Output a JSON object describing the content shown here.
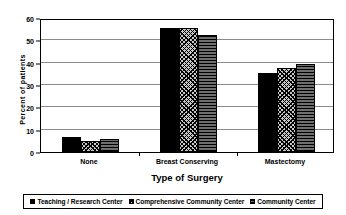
{
  "chart_data": {
    "type": "bar",
    "title": "",
    "xlabel": "Type of Surgery",
    "ylabel": "Percent of patients",
    "categories": [
      "None",
      "Breast Conserving",
      "Mastectomy"
    ],
    "series": [
      {
        "name": "Teaching / Research Center",
        "values": [
          6.5,
          55.5,
          35.5
        ],
        "pattern": "solid-black"
      },
      {
        "name": "Comprehensive Community Center",
        "values": [
          5.0,
          55.5,
          37.5
        ],
        "pattern": "cross-hatch"
      },
      {
        "name": "Community Center",
        "values": [
          6.0,
          52.5,
          39.5
        ],
        "pattern": "horizontal-lines"
      }
    ],
    "ylim": [
      0,
      60
    ],
    "yticks": [
      0,
      10,
      20,
      30,
      40,
      50,
      60
    ],
    "ytick_labels": [
      "0",
      "10",
      "20",
      "30",
      "40",
      "50",
      "60"
    ],
    "grid": true,
    "grid_axis": "y",
    "legend_position": "bottom",
    "colors": {
      "series_1": "#000000",
      "series_2": "#c9c9c9",
      "series_3": "#6f6f6f",
      "gridline": "#8a8a8a",
      "axis": "#000000",
      "background": "#ffffff"
    }
  }
}
